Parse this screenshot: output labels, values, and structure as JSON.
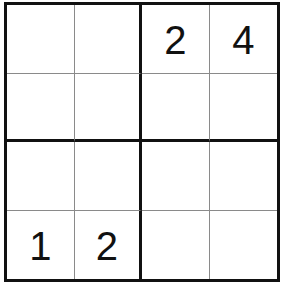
{
  "puzzle": {
    "type": "4x4 sudoku",
    "size": 4,
    "box_size": 2,
    "grid": [
      [
        "",
        "",
        "2",
        "4"
      ],
      [
        "",
        "",
        "",
        ""
      ],
      [
        "",
        "",
        "",
        ""
      ],
      [
        "1",
        "2",
        "",
        ""
      ]
    ]
  },
  "colors": {
    "background": "#ffffff",
    "thick_line": "#111111",
    "thin_line": "#8a8a8a",
    "digit": "#111111"
  }
}
